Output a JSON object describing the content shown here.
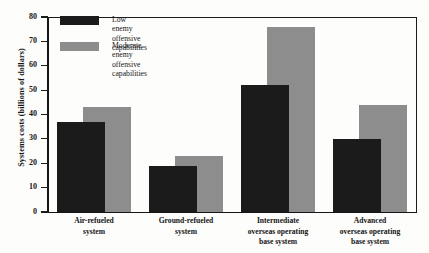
{
  "chart_data": {
    "type": "bar",
    "title": "",
    "subtitle": "",
    "xlabel": "",
    "ylabel": "Systems costs (billions of dollars)",
    "ylim": [
      0,
      80
    ],
    "ytick_labels": [
      "80",
      "70",
      "60",
      "50",
      "40",
      "30",
      "20",
      "10",
      "0"
    ],
    "ytick_values": [
      80,
      70,
      60,
      50,
      40,
      30,
      20,
      10,
      0
    ],
    "grid": false,
    "legend_position": "top-left-inside",
    "categories": [
      "Air-refueled\nsystem",
      "Ground-refueled\nsystem",
      "Intermediate\noverseas operating\nbase system",
      "Advanced\noverseas operating\nbase system"
    ],
    "series": [
      {
        "name": "Low enemy offensive capabilities",
        "color": "#1b1b1b",
        "values": [
          37,
          19,
          52,
          30
        ]
      },
      {
        "name": "Moderate enemy offensive capabilities",
        "color": "#8d8d8d",
        "values": [
          43,
          23,
          76,
          44
        ]
      }
    ]
  },
  "legend": {
    "items": [
      {
        "label": "Low enemy offensive\ncapabilities",
        "swatch": "low"
      },
      {
        "label": "Moderate enemy offensive\ncapabilities",
        "swatch": "moderate"
      }
    ]
  },
  "axis": {
    "y_title": "Systems costs (billions of dollars)"
  }
}
